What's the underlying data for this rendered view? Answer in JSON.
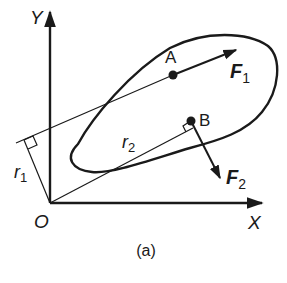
{
  "figure": {
    "caption": "(a)",
    "axes": {
      "x_label": "X",
      "y_label": "Y",
      "origin_label": "O"
    },
    "points": [
      {
        "name": "A",
        "label": "A"
      },
      {
        "name": "B",
        "label": "B"
      }
    ],
    "forces": [
      {
        "name": "F1",
        "symbol": "F",
        "subscript": "1",
        "applied_at": "A"
      },
      {
        "name": "F2",
        "symbol": "F",
        "subscript": "2",
        "applied_at": "B"
      }
    ],
    "moment_arms": [
      {
        "name": "r1",
        "symbol": "r",
        "subscript": "1"
      },
      {
        "name": "r2",
        "symbol": "r",
        "subscript": "2"
      }
    ],
    "colors": {
      "ink": "#1a1a1a",
      "background": "#ffffff"
    }
  }
}
